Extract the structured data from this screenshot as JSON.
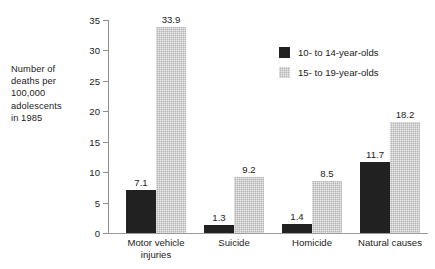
{
  "chart_data": {
    "type": "bar",
    "title": "",
    "subtitle": "",
    "xlabel": "",
    "ylabel": "Number of deaths per 100,000 adolescents in 1985",
    "ylabel_lines": [
      "Number of",
      "deaths per",
      "100,000",
      "adolescents",
      "in 1985"
    ],
    "categories": [
      "Motor vehicle injuries",
      "Suicide",
      "Homicide",
      "Natural causes"
    ],
    "category_label_lines": [
      [
        "Motor vehicle",
        "injuries"
      ],
      [
        "Suicide"
      ],
      [
        "Homicide"
      ],
      [
        "Natural causes"
      ]
    ],
    "series": [
      {
        "name": "10- to 14-year-olds",
        "color": "#212121",
        "values": [
          7.1,
          1.3,
          1.4,
          11.7
        ],
        "value_labels": [
          "7.1",
          "1.3",
          "1.4",
          "11.7"
        ]
      },
      {
        "name": "15- to 19-year-olds",
        "color": "#b6b6b6",
        "values": [
          33.9,
          9.2,
          8.5,
          18.2
        ],
        "value_labels": [
          "33.9",
          "9.2",
          "8.5",
          "18.2"
        ]
      }
    ],
    "ylim": [
      0,
      35
    ],
    "yticks": [
      0,
      5,
      10,
      15,
      20,
      25,
      30,
      35
    ],
    "ytick_labels": [
      "0",
      "5",
      "10",
      "15",
      "20",
      "25",
      "30",
      "35"
    ],
    "grid": false,
    "legend_position": "top-right",
    "axis_color": "#8e8e8e",
    "background": "#ffffff"
  },
  "legend": {
    "entries": [
      {
        "label": "10- to 14-year-olds",
        "swatch": "dark"
      },
      {
        "label": "15- to 19-year-olds",
        "swatch": "light"
      }
    ]
  }
}
